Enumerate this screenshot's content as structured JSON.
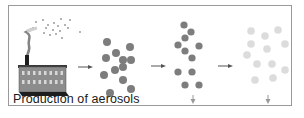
{
  "diagram": {
    "caption": "Production of aerosols",
    "top_cut_text": "···",
    "colors": {
      "frame": "#9a9a9a",
      "particle_dark": "#7d7d7d",
      "particle_light": "#dcdcdc",
      "factory_body": "#8c8c8c",
      "factory_roof": "#3a3a3a",
      "factory_base": "#1e1e1e",
      "window": "#d8d8d8",
      "arrow": "#555555",
      "smoke": "#6e6e6e",
      "emission_dots": "#9a9a9a"
    },
    "stages": [
      {
        "name": "production",
        "label": "Production of aerosols"
      },
      {
        "name": "dispersed-aerosols",
        "particle_count": 12
      },
      {
        "name": "settling-aerosols",
        "particle_count": 11
      },
      {
        "name": "deposited-aerosols",
        "particle_count": 12
      }
    ]
  }
}
